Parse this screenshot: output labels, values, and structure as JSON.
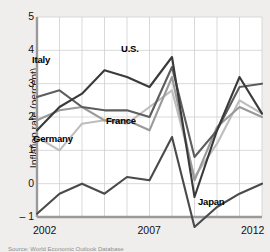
{
  "chart_data": {
    "type": "line",
    "title": "",
    "xlabel": "",
    "ylabel": "Inflation rate (percent)",
    "xlim": [
      2002,
      2012
    ],
    "ylim": [
      -1,
      5
    ],
    "yticks": [
      5,
      4,
      3,
      2,
      1,
      0,
      -1
    ],
    "ytick_labels": [
      "5",
      "4",
      "3",
      "2",
      "1",
      "0",
      "– 1"
    ],
    "xticks": [
      2002,
      2007,
      2012
    ],
    "xtick_labels": [
      "2002",
      "2007",
      "2012"
    ],
    "grid": true,
    "legend_position": "inline-annotations",
    "x": [
      2002,
      2003,
      2004,
      2005,
      2006,
      2007,
      2008,
      2009,
      2010,
      2011,
      2012
    ],
    "series": [
      {
        "name": "U.S.",
        "color": "#3a3a3a",
        "values": [
          1.6,
          2.3,
          2.7,
          3.4,
          3.2,
          2.9,
          3.8,
          -0.4,
          1.6,
          3.2,
          2.1
        ]
      },
      {
        "name": "Italy",
        "color": "#5d5d5d",
        "values": [
          2.6,
          2.8,
          2.3,
          2.2,
          2.2,
          2.0,
          3.5,
          0.8,
          1.6,
          2.9,
          3.0
        ]
      },
      {
        "name": "France",
        "color": "#9a9a9a",
        "values": [
          1.9,
          2.2,
          2.3,
          1.9,
          1.9,
          1.6,
          3.2,
          0.1,
          1.7,
          2.3,
          2.0
        ]
      },
      {
        "name": "Germany",
        "color": "#bdbdbd",
        "values": [
          1.4,
          1.0,
          1.8,
          1.9,
          1.8,
          2.3,
          2.8,
          0.2,
          1.2,
          2.5,
          2.1
        ]
      },
      {
        "name": "Japan",
        "color": "#4a4a4a",
        "values": [
          -0.9,
          -0.3,
          0.0,
          -0.3,
          0.2,
          0.1,
          1.4,
          -1.3,
          -0.7,
          -0.3,
          0.0
        ]
      }
    ],
    "annotations": [
      {
        "label": "Italy",
        "x_px": 32,
        "y_px": 54
      },
      {
        "label": "U.S.",
        "x_px": 121,
        "y_px": 43
      },
      {
        "label": "France",
        "x_px": 106,
        "y_px": 115
      },
      {
        "label": "Germany",
        "x_px": 33,
        "y_px": 133
      },
      {
        "label": "Japan",
        "x_px": 198,
        "y_px": 196
      }
    ]
  },
  "source": {
    "text": "Source: World Economic Outlook Database"
  },
  "colors": {
    "background": "#efeeec",
    "plot_background": "#ffffff",
    "grid": "#cfcfcf",
    "axis": "#9a9a9a",
    "text": "#111111"
  }
}
